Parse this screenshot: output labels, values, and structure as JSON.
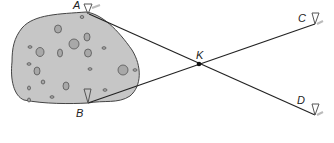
{
  "diagram": {
    "title": "",
    "points": {
      "A": {
        "label": "A"
      },
      "B": {
        "label": "B"
      },
      "C": {
        "label": "C"
      },
      "D": {
        "label": "D"
      },
      "K": {
        "label": "K"
      }
    },
    "segments": [
      [
        "A",
        "D"
      ],
      [
        "B",
        "C"
      ]
    ],
    "intersection": "K",
    "region": "rock / pond obstacle between A and B",
    "colors": {
      "region_fill": "#c8c8c8",
      "stroke": "#222222",
      "stake": "#555555"
    }
  }
}
